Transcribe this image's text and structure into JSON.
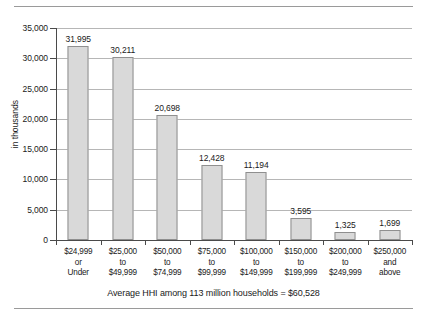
{
  "chart_data": {
    "type": "bar",
    "title": "",
    "xlabel": "",
    "ylabel": "in thousands",
    "ylim": [
      0,
      35000
    ],
    "yticks": [
      0,
      5000,
      10000,
      15000,
      20000,
      25000,
      30000,
      35000
    ],
    "ytick_labels": [
      "0",
      "5,000",
      "10,000",
      "15,000",
      "20,000",
      "25,000",
      "30,000",
      "35,000"
    ],
    "grid": true,
    "legend": "none",
    "categories": [
      "$24,999 or Under",
      "$25,000 to $49,999",
      "$50,000 to $74,999",
      "$75,000 to $99,999",
      "$100,000 to $149,999",
      "$150,000 to $199,999",
      "$200,000 to $249,999",
      "$250,000 and above"
    ],
    "category_lines": [
      [
        "$24,999",
        "or",
        "Under"
      ],
      [
        "$25,000",
        "to",
        "$49,999"
      ],
      [
        "$50,000",
        "to",
        "$74,999"
      ],
      [
        "$75,000",
        "to",
        "$99,999"
      ],
      [
        "$100,000",
        "to",
        "$149,999"
      ],
      [
        "$150,000",
        "to",
        "$199,999"
      ],
      [
        "$200,000",
        "to",
        "$249,999"
      ],
      [
        "$250,000",
        "and",
        "above"
      ]
    ],
    "values": [
      31995,
      30211,
      20698,
      12428,
      11194,
      3595,
      1325,
      1699
    ],
    "value_labels": [
      "31,995",
      "30,211",
      "20,698",
      "12,428",
      "11,194",
      "3,595",
      "1,325",
      "1,699"
    ],
    "annotation": "Average HHI among 113 million households = $60,528",
    "colors": {
      "bar_fill": "#d9d9d9",
      "bar_stroke": "#8f8f8f",
      "gridline": "#b6b6b6",
      "axis": "#4a4a4a",
      "text": "#1a1a1a",
      "rule": "#9a9a9a"
    }
  }
}
